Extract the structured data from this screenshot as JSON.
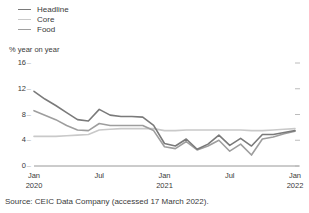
{
  "legend": {
    "items": [
      {
        "label": "Headline",
        "color": "#7a7a7a",
        "name": "legend-item-headline"
      },
      {
        "label": "Core",
        "color": "#c9c9c9",
        "name": "legend-item-core"
      },
      {
        "label": "Food",
        "color": "#9e9e9e",
        "name": "legend-item-food"
      }
    ]
  },
  "axis_title": "% year on year",
  "source": "Source: CEIC Data Company (accessed 17 March 2022).",
  "chart_data": {
    "type": "line",
    "title": "",
    "xlabel": "",
    "ylabel": "% year on year",
    "ylim": [
      0,
      16
    ],
    "yticks": [
      0,
      4,
      8,
      12,
      16
    ],
    "ytick_labels": [
      "0",
      "4",
      "8",
      "12",
      "16"
    ],
    "grid": false,
    "legend_position": "top-left",
    "x": [
      "Jan 2020",
      "Feb 2020",
      "Mar 2020",
      "Apr 2020",
      "May 2020",
      "Jun 2020",
      "Jul 2020",
      "Aug 2020",
      "Sep 2020",
      "Oct 2020",
      "Nov 2020",
      "Dec 2020",
      "Jan 2021",
      "Feb 2021",
      "Mar 2021",
      "Apr 2021",
      "May 2021",
      "Jun 2021",
      "Jul 2021",
      "Aug 2021",
      "Sep 2021",
      "Oct 2021",
      "Nov 2021",
      "Dec 2021",
      "Jan 2022"
    ],
    "xtick_positions": [
      "Jan 2020",
      "Jul 2020",
      "Jan 2021",
      "Jul 2021",
      "Jan 2022"
    ],
    "xtick_labels": [
      {
        "line1": "Jan",
        "line2": "2020"
      },
      {
        "line1": "Jul",
        "line2": ""
      },
      {
        "line1": "Jan",
        "line2": "2021"
      },
      {
        "line1": "Jul",
        "line2": ""
      },
      {
        "line1": "Jan",
        "line2": "2022"
      }
    ],
    "series": [
      {
        "name": "Headline",
        "color": "#7a7a7a",
        "values": [
          11.6,
          10.4,
          9.4,
          8.3,
          7.2,
          7.0,
          8.8,
          7.9,
          7.7,
          7.7,
          7.6,
          6.3,
          3.5,
          3.1,
          4.2,
          2.6,
          3.4,
          4.8,
          3.2,
          4.3,
          3.1,
          4.9,
          4.9,
          5.2,
          5.5
        ]
      },
      {
        "name": "Core",
        "color": "#c9c9c9",
        "values": [
          4.6,
          4.6,
          4.6,
          4.7,
          4.8,
          4.9,
          5.6,
          5.7,
          5.8,
          5.8,
          5.8,
          5.8,
          5.5,
          5.5,
          5.6,
          5.6,
          5.6,
          5.6,
          5.6,
          5.6,
          5.5,
          5.5,
          5.6,
          5.7,
          5.8
        ]
      },
      {
        "name": "Food",
        "color": "#9e9e9e",
        "values": [
          8.6,
          7.9,
          7.2,
          6.3,
          5.6,
          5.5,
          6.6,
          6.3,
          6.3,
          6.3,
          6.3,
          5.5,
          3.0,
          2.7,
          3.8,
          2.5,
          3.1,
          4.0,
          2.3,
          3.4,
          1.7,
          4.2,
          4.5,
          5.0,
          5.4
        ]
      }
    ]
  }
}
